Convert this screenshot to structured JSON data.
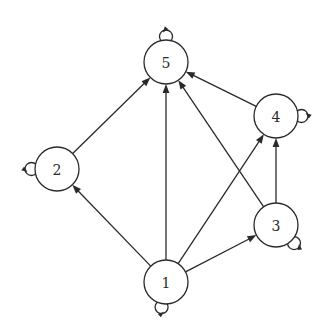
{
  "diagram": {
    "type": "directed-graph",
    "background": "#ffffff",
    "stroke_color": "#2a2a2a",
    "node_radius": 22,
    "nodes": [
      {
        "id": "1",
        "label": "1",
        "x": 166,
        "y": 282,
        "loop": {
          "angle": 100
        }
      },
      {
        "id": "2",
        "label": "2",
        "x": 57,
        "y": 169,
        "loop": {
          "angle": 180
        }
      },
      {
        "id": "3",
        "label": "3",
        "x": 276,
        "y": 225,
        "loop": {
          "angle": 45
        }
      },
      {
        "id": "4",
        "label": "4",
        "x": 276,
        "y": 116,
        "loop": {
          "angle": 0
        }
      },
      {
        "id": "5",
        "label": "5",
        "x": 166,
        "y": 62,
        "loop": {
          "angle": -90
        }
      }
    ],
    "edges": [
      {
        "from": "2",
        "to": "5"
      },
      {
        "from": "1",
        "to": "5"
      },
      {
        "from": "3",
        "to": "5"
      },
      {
        "from": "4",
        "to": "5"
      },
      {
        "from": "1",
        "to": "2"
      },
      {
        "from": "1",
        "to": "4"
      },
      {
        "from": "1",
        "to": "3"
      },
      {
        "from": "3",
        "to": "4"
      }
    ]
  }
}
